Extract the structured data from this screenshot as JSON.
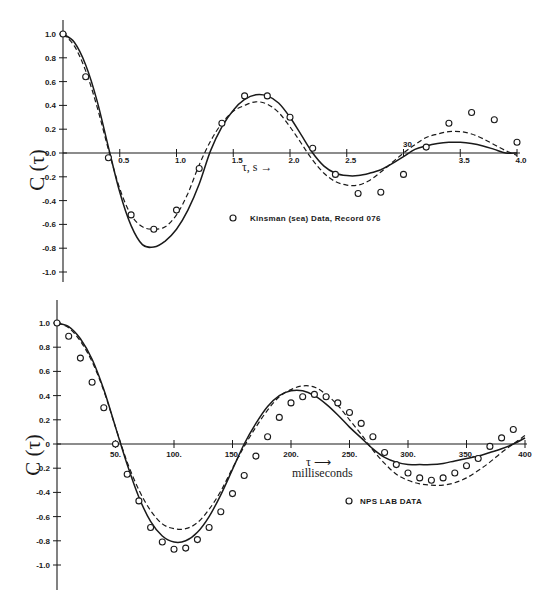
{
  "figure": {
    "background": "#ffffff",
    "ink": "#1a1a1a"
  },
  "chart_data": [
    {
      "type": "line",
      "panel": "top",
      "title": "",
      "xlabel": "τ, s →",
      "ylabel": "C (τ)",
      "xlim": [
        0,
        4.0
      ],
      "ylim": [
        -1.0,
        1.0
      ],
      "grid": false,
      "x_ticks": [
        0.5,
        1.0,
        1.5,
        2.0,
        2.5,
        3.0,
        3.5,
        4.0
      ],
      "x_tick_labels": [
        "0.5",
        "1.0",
        "1.5",
        "2.0",
        "2.5",
        "30",
        "3.5",
        "4.0"
      ],
      "y_ticks": [
        1.0,
        0.8,
        0.6,
        0.4,
        0.2,
        0.0,
        -0.2,
        -0.4,
        -0.6,
        -0.8,
        -1.0
      ],
      "y_tick_labels": [
        "1.0",
        "0.8",
        "0.6",
        "0.4",
        "0.2",
        "0.0",
        "-0.2",
        "-0.4",
        "-0.6",
        "-0.8",
        "-1.0"
      ],
      "legend": [
        {
          "marker": "open-circle",
          "label": "Kinsman (sea) Data, Record 076"
        }
      ],
      "legend_position": "lower-center",
      "series": [
        {
          "name": "Kinsman (sea) Data, Record 076",
          "style": "markers",
          "x": [
            0.0,
            0.2,
            0.4,
            0.6,
            0.8,
            1.0,
            1.2,
            1.4,
            1.6,
            1.8,
            2.0,
            2.2,
            2.4,
            2.6,
            2.8,
            3.0,
            3.2,
            3.4,
            3.6,
            3.8,
            4.0
          ],
          "y": [
            1.0,
            0.64,
            -0.04,
            -0.52,
            -0.64,
            -0.48,
            -0.13,
            0.25,
            0.48,
            0.48,
            0.3,
            0.04,
            -0.18,
            -0.34,
            -0.33,
            -0.18,
            0.05,
            0.25,
            0.34,
            0.28,
            0.09
          ]
        },
        {
          "name": "model (solid)",
          "style": "solid",
          "x": [
            0.0,
            0.1,
            0.2,
            0.3,
            0.4,
            0.5,
            0.6,
            0.7,
            0.8,
            0.9,
            1.0,
            1.1,
            1.2,
            1.3,
            1.4,
            1.5,
            1.6,
            1.7,
            1.8,
            1.9,
            2.0,
            2.1,
            2.2,
            2.3,
            2.4,
            2.5,
            2.6,
            2.7,
            2.8,
            2.9,
            3.0,
            3.1,
            3.2,
            3.3,
            3.4,
            3.5,
            3.6,
            3.7,
            3.8,
            3.9,
            4.0
          ],
          "y": [
            1.0,
            0.93,
            0.74,
            0.44,
            0.05,
            -0.33,
            -0.61,
            -0.77,
            -0.79,
            -0.74,
            -0.64,
            -0.48,
            -0.26,
            0.02,
            0.22,
            0.36,
            0.45,
            0.49,
            0.48,
            0.42,
            0.3,
            0.15,
            0.0,
            -0.11,
            -0.17,
            -0.19,
            -0.19,
            -0.17,
            -0.14,
            -0.09,
            -0.03,
            0.03,
            0.06,
            0.08,
            0.09,
            0.09,
            0.08,
            0.06,
            0.03,
            0.0,
            0.0
          ]
        },
        {
          "name": "model (dashed)",
          "style": "dashed",
          "x": [
            0.0,
            0.1,
            0.2,
            0.3,
            0.4,
            0.5,
            0.6,
            0.7,
            0.8,
            0.9,
            1.0,
            1.1,
            1.2,
            1.3,
            1.4,
            1.5,
            1.6,
            1.7,
            1.8,
            1.9,
            2.0,
            2.1,
            2.2,
            2.3,
            2.4,
            2.5,
            2.6,
            2.7,
            2.8,
            2.9,
            3.0,
            3.1,
            3.2,
            3.3,
            3.4,
            3.5,
            3.6,
            3.7,
            3.8,
            3.9,
            4.0
          ],
          "y": [
            1.0,
            0.9,
            0.69,
            0.39,
            0.03,
            -0.3,
            -0.52,
            -0.62,
            -0.64,
            -0.62,
            -0.52,
            -0.34,
            -0.1,
            0.1,
            0.25,
            0.35,
            0.4,
            0.43,
            0.41,
            0.34,
            0.22,
            0.08,
            -0.06,
            -0.17,
            -0.24,
            -0.27,
            -0.27,
            -0.23,
            -0.16,
            -0.08,
            0.0,
            0.07,
            0.13,
            0.16,
            0.18,
            0.18,
            0.16,
            0.12,
            0.07,
            0.02,
            -0.02
          ]
        }
      ]
    },
    {
      "type": "line",
      "panel": "bottom",
      "title": "",
      "xlabel": "τ → milliseconds",
      "ylabel": "C (τ)",
      "xlim": [
        0,
        400
      ],
      "ylim": [
        -1.0,
        1.0
      ],
      "grid": false,
      "x_ticks": [
        50,
        100,
        150,
        200,
        250,
        300,
        350,
        400
      ],
      "x_tick_labels": [
        "50.",
        "100.",
        "150.",
        "200.",
        "250.",
        "300.",
        "350.",
        "400"
      ],
      "y_ticks": [
        1.0,
        0.8,
        0.6,
        0.4,
        0.2,
        0.0,
        -0.2,
        -0.4,
        -0.6,
        -0.8,
        -1.0
      ],
      "y_tick_labels": [
        "1.0",
        "0.8",
        "0.6",
        "0.4",
        "0.2",
        "0",
        "-0.2",
        "-0.4",
        "-0.6",
        "-0.8",
        "-1.0"
      ],
      "legend": [
        {
          "marker": "open-circle",
          "label": "NPS LAB DATA"
        }
      ],
      "legend_position": "lower-right",
      "series": [
        {
          "name": "NPS LAB DATA",
          "style": "markers",
          "x": [
            0,
            10,
            20,
            30,
            40,
            50,
            60,
            70,
            80,
            90,
            100,
            110,
            120,
            130,
            140,
            150,
            160,
            170,
            180,
            190,
            200,
            210,
            220,
            230,
            240,
            250,
            260,
            270,
            280,
            290,
            300,
            310,
            320,
            330,
            340,
            350,
            360,
            370,
            380,
            390
          ],
          "y": [
            1.0,
            0.89,
            0.71,
            0.51,
            0.3,
            0.0,
            -0.25,
            -0.47,
            -0.69,
            -0.81,
            -0.87,
            -0.86,
            -0.79,
            -0.69,
            -0.56,
            -0.41,
            -0.26,
            -0.1,
            0.06,
            0.22,
            0.34,
            0.39,
            0.41,
            0.39,
            0.34,
            0.26,
            0.17,
            0.06,
            -0.07,
            -0.17,
            -0.24,
            -0.28,
            -0.3,
            -0.28,
            -0.24,
            -0.18,
            -0.12,
            -0.02,
            0.05,
            0.12
          ]
        },
        {
          "name": "model (solid)",
          "style": "solid",
          "x": [
            0,
            10,
            20,
            30,
            40,
            50,
            60,
            70,
            80,
            90,
            100,
            110,
            120,
            130,
            140,
            150,
            160,
            170,
            180,
            190,
            200,
            210,
            220,
            230,
            240,
            250,
            260,
            270,
            280,
            290,
            300,
            310,
            320,
            330,
            340,
            350,
            360,
            370,
            380,
            390,
            400
          ],
          "y": [
            1.0,
            0.97,
            0.87,
            0.7,
            0.45,
            0.14,
            -0.17,
            -0.44,
            -0.64,
            -0.76,
            -0.81,
            -0.8,
            -0.73,
            -0.6,
            -0.42,
            -0.21,
            0.0,
            0.17,
            0.31,
            0.4,
            0.44,
            0.44,
            0.4,
            0.33,
            0.24,
            0.14,
            0.05,
            -0.04,
            -0.11,
            -0.15,
            -0.17,
            -0.17,
            -0.17,
            -0.16,
            -0.14,
            -0.12,
            -0.1,
            -0.07,
            -0.04,
            0.0,
            0.05
          ]
        },
        {
          "name": "model (dashed)",
          "style": "dashed",
          "x": [
            0,
            10,
            20,
            30,
            40,
            50,
            60,
            70,
            80,
            90,
            100,
            110,
            120,
            130,
            140,
            150,
            160,
            170,
            180,
            190,
            200,
            210,
            220,
            230,
            240,
            250,
            260,
            270,
            280,
            290,
            300,
            310,
            320,
            330,
            340,
            350,
            360,
            370,
            380,
            390,
            400
          ],
          "y": [
            1.0,
            0.96,
            0.85,
            0.68,
            0.44,
            0.14,
            -0.15,
            -0.38,
            -0.55,
            -0.66,
            -0.7,
            -0.7,
            -0.65,
            -0.54,
            -0.39,
            -0.2,
            -0.02,
            0.14,
            0.28,
            0.39,
            0.45,
            0.48,
            0.47,
            0.41,
            0.32,
            0.2,
            0.08,
            -0.05,
            -0.16,
            -0.25,
            -0.3,
            -0.33,
            -0.34,
            -0.34,
            -0.32,
            -0.28,
            -0.22,
            -0.15,
            -0.07,
            0.0,
            0.07
          ]
        }
      ]
    }
  ]
}
